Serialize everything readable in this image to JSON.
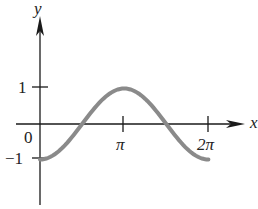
{
  "chart_data": {
    "type": "line",
    "title": "",
    "function": "y = -cos(x)",
    "xlabel": "x",
    "ylabel": "y",
    "xlim": [
      0,
      6.2832
    ],
    "ylim": [
      -1,
      1
    ],
    "x_ticks": [
      {
        "value": 0,
        "label": "0"
      },
      {
        "value": 3.1416,
        "label": "π"
      },
      {
        "value": 6.2832,
        "label": "2π"
      }
    ],
    "y_ticks": [
      {
        "value": 1,
        "label": "1"
      },
      {
        "value": -1,
        "label": "−1"
      }
    ],
    "series": [
      {
        "name": "-cos(x)",
        "color": "#8a8a8a",
        "x": [
          0,
          0.7854,
          1.5708,
          2.3562,
          3.1416,
          3.927,
          4.7124,
          5.4978,
          6.2832
        ],
        "values": [
          -1,
          -0.7071,
          0,
          0.7071,
          1,
          0.7071,
          0,
          -0.7071,
          -1
        ]
      }
    ],
    "grid": false,
    "legend": null
  },
  "labels": {
    "x_axis": "x",
    "y_axis": "y",
    "origin": "0",
    "pi": "π",
    "two_pi": "2π",
    "one": "1",
    "neg_one": "−1"
  },
  "colors": {
    "axis": "#1a1a1a",
    "curve": "#8a8a8a"
  }
}
